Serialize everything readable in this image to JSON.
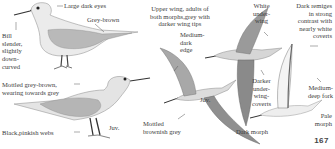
{
  "plate": {
    "page_number": "167",
    "labels": {
      "eyes": "Large dark eyes",
      "grey_brown": "Grey-brown",
      "bill": [
        "Bill",
        "slender,",
        "slightly",
        "down-",
        "curved"
      ],
      "mottled_adult": [
        "Mottled grey-brown,",
        "wearing towards grey"
      ],
      "webs": "Black,pinkish webs",
      "juv_standing": "Juv.",
      "upper_wing": [
        "Upper wing, adults of",
        "both morphs,grey with",
        "darker wing tips"
      ],
      "medium_dark_edge": [
        "Medium-",
        "dark",
        "edge"
      ],
      "juv_flying": "Juv.",
      "mottled_flying": [
        "Mottled",
        "brownish grey"
      ],
      "white_underwing": [
        "White",
        "under-",
        "wing"
      ],
      "dark_remiges": [
        "Dark remiges",
        "in strong",
        "contrast with",
        "nearly white",
        "coverts"
      ],
      "darker_underwing": [
        "Darker",
        "under-",
        "wing-",
        "coverts"
      ],
      "dark_morph": "Dark morph",
      "medium_deep_fork": [
        "Medium-",
        "deep fork"
      ],
      "pale_morph": [
        "Pale",
        "morph"
      ]
    }
  }
}
